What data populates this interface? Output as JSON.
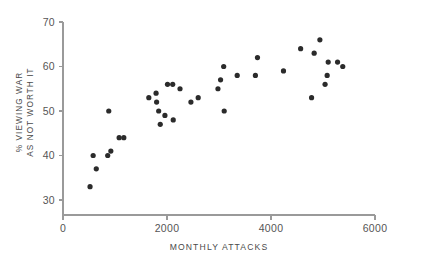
{
  "chart_data": {
    "type": "scatter",
    "title": "",
    "xlabel": "MONTHLY ATTACKS",
    "ylabel": "% VIEWING WAR AS NOT WORTH IT",
    "ylabel_line1": "% VIEWING WAR",
    "ylabel_line2": "AS NOT WORTH IT",
    "xlim": [
      0,
      6000
    ],
    "ylim": [
      28,
      70
    ],
    "xticks": [
      0,
      2000,
      4000,
      6000
    ],
    "xtick_labels": [
      "0",
      "2000",
      "4000",
      "6000"
    ],
    "yticks": [
      30,
      40,
      50,
      60,
      70
    ],
    "ytick_labels": [
      "30",
      "40",
      "50",
      "60",
      "70"
    ],
    "grid": false,
    "legend": null,
    "marker_color": "#2b2b2b",
    "axis_color": "#9a9a9a",
    "marker_radius": 2.6,
    "points": [
      {
        "x": 520,
        "y": 33
      },
      {
        "x": 580,
        "y": 40
      },
      {
        "x": 640,
        "y": 37
      },
      {
        "x": 860,
        "y": 40
      },
      {
        "x": 880,
        "y": 50
      },
      {
        "x": 920,
        "y": 41
      },
      {
        "x": 1080,
        "y": 44
      },
      {
        "x": 1170,
        "y": 44
      },
      {
        "x": 1650,
        "y": 53
      },
      {
        "x": 1790,
        "y": 54
      },
      {
        "x": 1800,
        "y": 52
      },
      {
        "x": 1840,
        "y": 50
      },
      {
        "x": 1870,
        "y": 47
      },
      {
        "x": 1960,
        "y": 49
      },
      {
        "x": 2010,
        "y": 56
      },
      {
        "x": 2110,
        "y": 56
      },
      {
        "x": 2120,
        "y": 48
      },
      {
        "x": 2250,
        "y": 55
      },
      {
        "x": 2460,
        "y": 52
      },
      {
        "x": 2600,
        "y": 53
      },
      {
        "x": 2980,
        "y": 55
      },
      {
        "x": 3030,
        "y": 57
      },
      {
        "x": 3090,
        "y": 60
      },
      {
        "x": 3100,
        "y": 50
      },
      {
        "x": 3350,
        "y": 58
      },
      {
        "x": 3700,
        "y": 58
      },
      {
        "x": 3740,
        "y": 62
      },
      {
        "x": 4240,
        "y": 59
      },
      {
        "x": 4570,
        "y": 64
      },
      {
        "x": 4780,
        "y": 53
      },
      {
        "x": 4830,
        "y": 63
      },
      {
        "x": 4940,
        "y": 66
      },
      {
        "x": 5040,
        "y": 56
      },
      {
        "x": 5080,
        "y": 58
      },
      {
        "x": 5100,
        "y": 61
      },
      {
        "x": 5280,
        "y": 61
      },
      {
        "x": 5380,
        "y": 60
      }
    ]
  }
}
